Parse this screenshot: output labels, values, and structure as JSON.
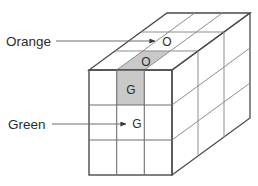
{
  "figure": {
    "type": "cube-grid-diagram",
    "background_color": "#ffffff",
    "outline_color": "#4a4a4a",
    "gridline_color": "#8d8d8d",
    "shaded_cell_color": "#c9c9c9",
    "text_color": "#2b2b2b",
    "leader_color": "#6e6e6e"
  },
  "labels": {
    "orange": {
      "text": "Orange",
      "x": 6,
      "y": 45
    },
    "green": {
      "text": "Green",
      "x": 8,
      "y": 129
    }
  },
  "cell_letters": {
    "top_arrow_O": {
      "text": "O",
      "x": 167,
      "y": 46
    },
    "top_shaded_O": {
      "text": "O",
      "x": 146,
      "y": 66
    },
    "front_shaded_G": {
      "text": "G",
      "x": 141,
      "y": 94
    },
    "front_arrow_G": {
      "text": "G",
      "x": 141,
      "y": 128
    }
  },
  "leaders": {
    "orange_line": {
      "from_x": 56,
      "from_y": 41,
      "to_x": 156,
      "to_y": 41
    },
    "green_line": {
      "from_x": 52,
      "from_y": 124,
      "to_x": 127,
      "to_y": 124
    }
  },
  "geometry": {
    "front_face": {
      "left": 89,
      "top": 70,
      "right": 172,
      "bottom": 175,
      "rows": 3,
      "cols": 3
    },
    "depth_vector": {
      "dx": 78,
      "dy": -57
    },
    "top_back_left": {
      "x": 167,
      "y": 13
    }
  },
  "highlighted": [
    {
      "name": "top-face-front-middle",
      "letter": "O",
      "color": "#c9c9c9"
    },
    {
      "name": "front-face-top-middle",
      "letter": "G",
      "color": "#c9c9c9"
    }
  ]
}
